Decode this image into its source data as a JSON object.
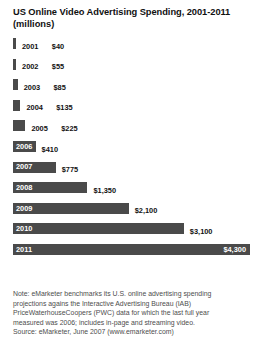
{
  "chart_data": {
    "type": "bar",
    "orientation": "horizontal",
    "title": "US Online Video Advertising Spending, 2001-2011",
    "subtitle": "(millions)",
    "xlabel": "",
    "ylabel": "",
    "grid": false,
    "legend": null,
    "value_prefix": "$",
    "xlim": [
      0,
      4300
    ],
    "categories": [
      "2001",
      "2002",
      "2003",
      "2004",
      "2005",
      "2006",
      "2007",
      "2008",
      "2009",
      "2010",
      "2011"
    ],
    "values": [
      40,
      55,
      85,
      135,
      225,
      410,
      775,
      1350,
      2100,
      3100,
      4300
    ],
    "value_labels": [
      "$40",
      "$55",
      "$85",
      "$135",
      "$225",
      "$410",
      "$775",
      "$1,350",
      "$2,100",
      "$3,100",
      "$4,300"
    ],
    "bars": [
      {
        "year": "2001",
        "value": 40,
        "value_label": "$40",
        "label_inside": false,
        "value_inside": false
      },
      {
        "year": "2002",
        "value": 55,
        "value_label": "$55",
        "label_inside": false,
        "value_inside": false
      },
      {
        "year": "2003",
        "value": 85,
        "value_label": "$85",
        "label_inside": false,
        "value_inside": false
      },
      {
        "year": "2004",
        "value": 135,
        "value_label": "$135",
        "label_inside": false,
        "value_inside": false
      },
      {
        "year": "2005",
        "value": 225,
        "value_label": "$225",
        "label_inside": false,
        "value_inside": false
      },
      {
        "year": "2006",
        "value": 410,
        "value_label": "$410",
        "label_inside": true,
        "value_inside": false
      },
      {
        "year": "2007",
        "value": 775,
        "value_label": "$775",
        "label_inside": true,
        "value_inside": false
      },
      {
        "year": "2008",
        "value": 1350,
        "value_label": "$1,350",
        "label_inside": true,
        "value_inside": false
      },
      {
        "year": "2009",
        "value": 2100,
        "value_label": "$2,100",
        "label_inside": true,
        "value_inside": false
      },
      {
        "year": "2010",
        "value": 3100,
        "value_label": "$3,100",
        "label_inside": true,
        "value_inside": false
      },
      {
        "year": "2011",
        "value": 4300,
        "value_label": "$4,300",
        "label_inside": true,
        "value_inside": true
      }
    ],
    "bar_color": "#4a4a4a",
    "note_lines": [
      "Note: eMarketer benchmarks its U.S. online advertising spending",
      "projections agains the Interactive Advertising Bureau (IAB)",
      "PriceWaterhouseCoopers (PWC) data for which the last full year",
      "measured was 2006; includes in-page and streaming video."
    ],
    "source": "Source: eMarketer, June 2007 (www.emarketer.com)"
  }
}
